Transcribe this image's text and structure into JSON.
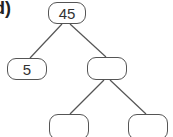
{
  "figure_label": "d)",
  "tree": {
    "root": {
      "value": "45"
    },
    "left": {
      "value": "5"
    },
    "right": {
      "value": ""
    },
    "right_left": {
      "value": ""
    },
    "right_right": {
      "value": ""
    }
  }
}
